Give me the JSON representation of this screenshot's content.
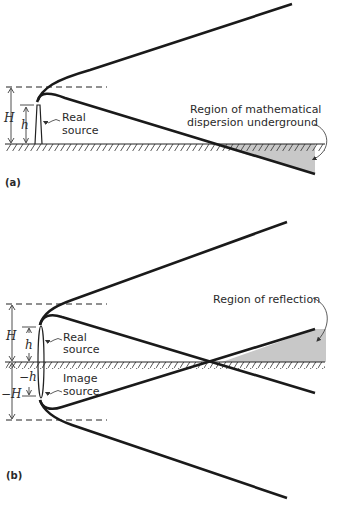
{
  "figure": {
    "panel_a": {
      "label": "(a)",
      "source_label_line1": "Real",
      "source_label_line2": "source",
      "H_label": "H",
      "h_label": "h",
      "region_label_line1": "Region of mathematical",
      "region_label_line2": "dispersion underground"
    },
    "panel_b": {
      "label": "(b)",
      "real_source_line1": "Real",
      "real_source_line2": "source",
      "image_source_line1": "Image",
      "image_source_line2": "source",
      "H_label": "H",
      "h_label": "h",
      "neg_h_label": "−h",
      "neg_H_label": "−H",
      "region_label": "Region of reflection"
    },
    "colors": {
      "line": "#1a1a1a",
      "shade": "#c8c8c8",
      "text": "#2a2a2a"
    }
  }
}
